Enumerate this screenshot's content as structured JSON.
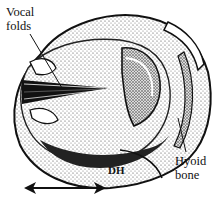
{
  "figure": {
    "type": "anatomical-illustration",
    "labels": {
      "vocal_folds_line1": "Vocal",
      "vocal_folds_line2": "folds",
      "hyoid_line1": "Hyoid",
      "hyoid_line2": "bone",
      "dh": "DH"
    },
    "scale_indicator": "double-headed-arrow",
    "colors": {
      "ink": "#111111",
      "shade": "#555555",
      "paper": "#ffffff"
    }
  }
}
